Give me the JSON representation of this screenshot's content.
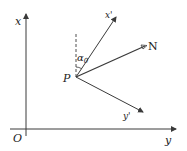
{
  "diagram": {
    "type": "coordinate-rotation",
    "colors": {
      "stroke": "#3a3a3a",
      "text": "#222222",
      "background": "#ffffff"
    },
    "axes": {
      "vertical_label": "x",
      "horizontal_label": "y",
      "origin_label": "O"
    },
    "point": {
      "label": "P"
    },
    "rotated_axes": {
      "x_prime_label": "x'",
      "y_prime_label": "y'"
    },
    "direction": {
      "label": "N"
    },
    "angle": {
      "label": "α",
      "subscript": "0"
    }
  }
}
